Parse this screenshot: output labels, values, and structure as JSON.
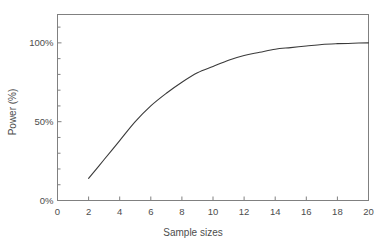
{
  "chart_data": {
    "type": "line",
    "title": "",
    "xlabel": "Sample sizes",
    "ylabel": "Power (%)",
    "xlim": [
      0,
      20
    ],
    "ylim": [
      0,
      118
    ],
    "grid": false,
    "legend": null,
    "x_ticks": [
      "0",
      "2",
      "4",
      "6",
      "8",
      "10",
      "12",
      "14",
      "16",
      "18",
      "20"
    ],
    "x_tick_values": [
      0,
      2,
      4,
      6,
      8,
      10,
      12,
      14,
      16,
      18,
      20
    ],
    "y_ticks": [
      "0%",
      "50%",
      "100%"
    ],
    "y_tick_values": [
      0,
      50,
      100
    ],
    "y_minor_tick_values": [
      10,
      20,
      30,
      40,
      60,
      70,
      80,
      90,
      110
    ],
    "series": [
      {
        "name": "Power",
        "color": "#3a3a3a",
        "x": [
          2,
          3,
          4,
          5,
          6,
          7,
          8,
          9,
          10,
          11,
          12,
          13,
          14,
          15,
          16,
          17,
          18,
          19,
          20
        ],
        "values": [
          14,
          26,
          38,
          50,
          60,
          68,
          75,
          81,
          85,
          89,
          92,
          94,
          96,
          97,
          98,
          99,
          99.5,
          99.8,
          100
        ]
      }
    ]
  },
  "axes": {
    "frame_color": "#808080",
    "tick_color": "#808080",
    "text_color": "#4d4d4d",
    "background": "#ffffff"
  }
}
